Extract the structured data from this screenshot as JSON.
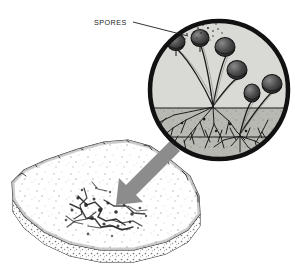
{
  "figure": {
    "background_color": "#ffffff"
  },
  "labels": {
    "spores": "SPORES"
  },
  "colors": {
    "ink": "#1c1c1c",
    "circle_ring": "#111111",
    "circle_fill": "#d9d9d6",
    "substrate_fill": "#b9b9b4",
    "arrow": "#8c8c8c",
    "bread_fill": "#ffffff",
    "bread_outline": "#2b2b2b",
    "mold_patch": "#2a2a2a",
    "sporangium_fill": "#4a4a4a"
  },
  "inset": {
    "shape": "circle",
    "center_x": 219,
    "center_y": 90,
    "radius": 71,
    "ring_width": 4,
    "description": "magnified view of bread mold"
  },
  "bread": {
    "description": "slice of bread in perspective with mold patch",
    "mold_patch_x": 108,
    "mold_patch_y": 212
  },
  "arrow": {
    "description": "gray arrow pointing from upper right to mold patch on bread",
    "from_x": 168,
    "from_y": 145,
    "to_x": 120,
    "to_y": 200
  },
  "leader_line": {
    "description": "leader from SPORES label to spore cloud inside circle",
    "from_x": 132,
    "from_y": 22,
    "to_x": 186,
    "to_y": 35
  },
  "sporangia": [
    {
      "id": 1,
      "head_x": 176,
      "head_y": 42,
      "head_rx": 9,
      "head_ry": 9,
      "base_x": 213,
      "base_y": 106
    },
    {
      "id": 2,
      "head_x": 200,
      "head_y": 38,
      "head_rx": 9,
      "head_ry": 9,
      "base_x": 213,
      "base_y": 106
    },
    {
      "id": 3,
      "head_x": 225,
      "head_y": 47,
      "head_rx": 10,
      "head_ry": 10,
      "base_x": 213,
      "base_y": 106
    },
    {
      "id": 4,
      "head_x": 237,
      "head_y": 70,
      "head_rx": 10,
      "head_ry": 10,
      "base_x": 213,
      "base_y": 106
    },
    {
      "id": 5,
      "head_x": 252,
      "head_y": 93,
      "head_rx": 8,
      "head_ry": 9,
      "base_x": 240,
      "base_y": 135
    },
    {
      "id": 6,
      "head_x": 272,
      "head_y": 84,
      "head_rx": 10,
      "head_ry": 10,
      "base_x": 240,
      "base_y": 135
    }
  ]
}
